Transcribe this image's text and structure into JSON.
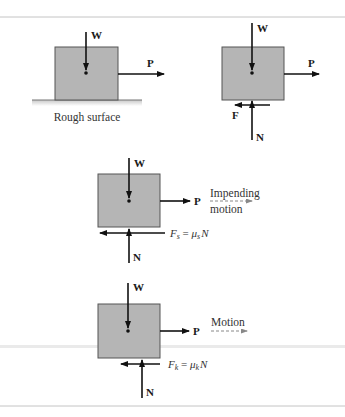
{
  "figure": {
    "colors": {
      "block_fill": "#b5b5b5",
      "block_stroke": "#555555",
      "arrow": "#111111",
      "rule": "#bdbdbd",
      "dashed_motion": "#888888"
    },
    "panels": [
      {
        "id": "a",
        "labels": {
          "weight": "W",
          "push": "P"
        },
        "caption": "Rough surface"
      },
      {
        "id": "b",
        "labels": {
          "weight": "W",
          "push": "P",
          "friction": "F",
          "normal": "N"
        }
      },
      {
        "id": "c",
        "labels": {
          "weight": "W",
          "push": "P",
          "normal": "N"
        },
        "friction_eq": {
          "F": "F",
          "sub": "s",
          "eq": " = ",
          "mu": "μ",
          "mu_sub": "s",
          "N": "N"
        },
        "motion_text_1": "Impending",
        "motion_text_2": "motion"
      },
      {
        "id": "d",
        "labels": {
          "weight": "W",
          "push": "P",
          "normal": "N"
        },
        "friction_eq": {
          "F": "F",
          "sub": "k",
          "eq": " = ",
          "mu": "μ",
          "mu_sub": "k",
          "N": "N"
        },
        "motion_text_1": "Motion"
      }
    ]
  }
}
